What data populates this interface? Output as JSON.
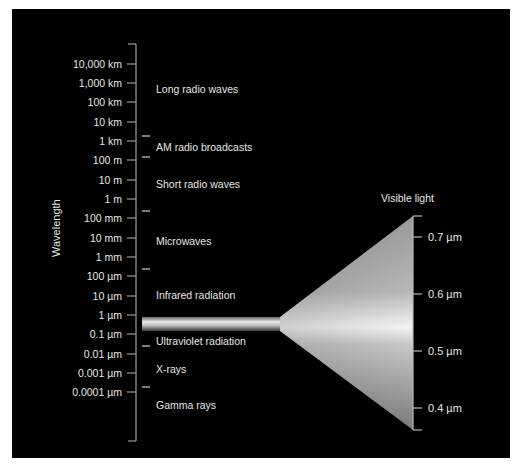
{
  "diagram": {
    "y_axis_title": "Wavelength",
    "wavelength_ticks": [
      "10,000 km",
      "1,000 km",
      "100 km",
      "10 km",
      "1 km",
      "100 m",
      "10 m",
      "1 m",
      "100 mm",
      "10 mm",
      "1 mm",
      "100 µm",
      "10 µm",
      "1 µm",
      "0.1 µm",
      "0.01 µm",
      "0.001 µm",
      "0.0001 µm"
    ],
    "bands": [
      {
        "label": "Long radio waves"
      },
      {
        "label": "AM radio broadcasts"
      },
      {
        "label": "Short radio waves"
      },
      {
        "label": "Microwaves"
      },
      {
        "label": "Infrared radiation"
      },
      {
        "label": "Ultraviolet radiation"
      },
      {
        "label": "X-rays"
      },
      {
        "label": "Gamma rays"
      }
    ],
    "visible_light": {
      "title": "Visible light",
      "ticks": [
        "0.7 µm",
        "0.6 µm",
        "0.5 µm",
        "0.4 µm"
      ]
    },
    "colors": {
      "background": "#000000",
      "text": "#e6e6e6",
      "axis": "#9a9a9a",
      "page": "#ffffff"
    }
  }
}
